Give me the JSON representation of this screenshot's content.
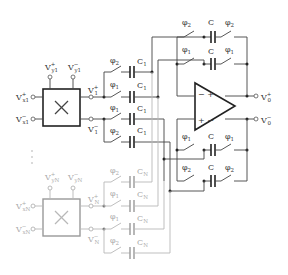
{
  "diagram": {
    "type": "switched-capacitor multiplier / summing circuit",
    "multipliers": [
      {
        "id": "1",
        "symbol": "×",
        "inputs_x": [
          "V+x1",
          "V-x1"
        ],
        "inputs_y": [
          "V+y1",
          "V-y1"
        ],
        "outputs": [
          "V+1",
          "V-1"
        ],
        "caps": [
          "C1",
          "C1",
          "C1",
          "C1"
        ],
        "switches": [
          "φ2",
          "φ1",
          "φ1",
          "φ2"
        ]
      },
      {
        "id": "N",
        "symbol": "×",
        "inputs_x": [
          "V+xN",
          "V-xN"
        ],
        "inputs_y": [
          "V+yN",
          "V-yN"
        ],
        "outputs": [
          "V+N",
          "V-N"
        ],
        "caps": [
          "CN",
          "CN",
          "CN",
          "CN"
        ],
        "switches": [
          "φ2",
          "φ1",
          "φ1",
          "φ2"
        ],
        "faded": true
      }
    ],
    "ellipsis": "⋮",
    "opamp": {
      "inputs": [
        "−",
        "+"
      ],
      "outputs": [
        "V+0",
        "V-0"
      ]
    },
    "feedback": [
      {
        "switch_left": "φ2",
        "cap": "C",
        "switch_right": "φ2"
      },
      {
        "switch_left": "φ1",
        "cap": "C",
        "switch_right": "φ1"
      },
      {
        "switch_left": "φ1",
        "cap": "C",
        "switch_right": "φ1"
      },
      {
        "switch_left": "φ2",
        "cap": "C",
        "switch_right": "φ2"
      }
    ]
  },
  "labels": {
    "V": "V",
    "phi": "φ",
    "C": "C",
    "x_box": "×",
    "sub_x1": "x1",
    "sub_y1": "y1",
    "sub_xN": "xN",
    "sub_yN": "yN",
    "sub_1": "1",
    "sub_N": "N",
    "sub_0": "0",
    "plus": "+",
    "minus": "−",
    "sub_phi1": "1",
    "sub_phi2": "2"
  }
}
